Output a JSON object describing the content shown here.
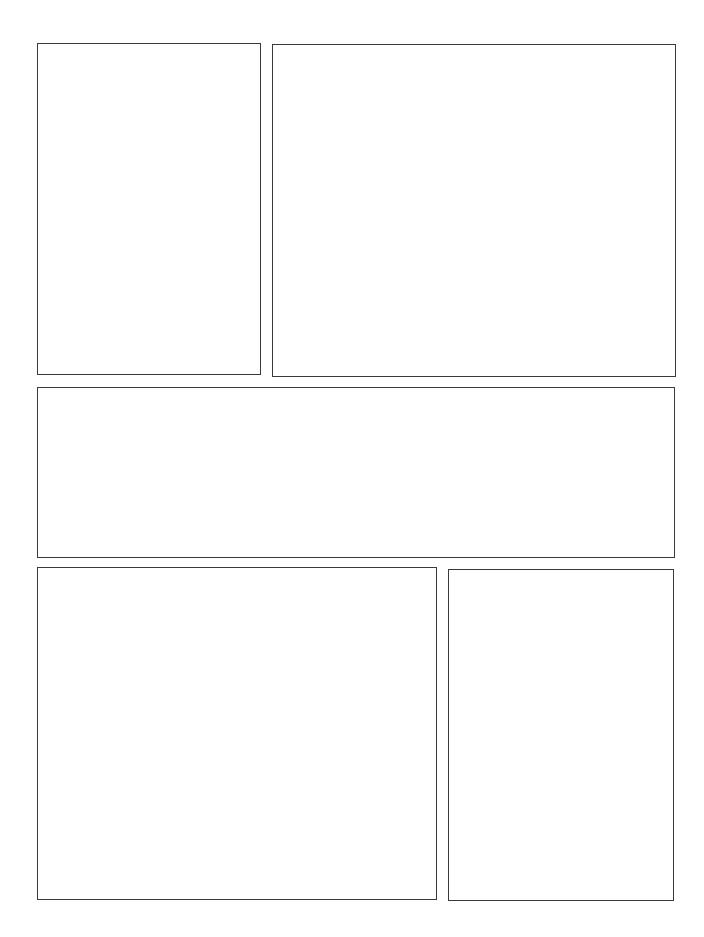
{
  "page": {
    "type": "comic-panel-template",
    "background": "#ffffff",
    "border_color": "#3a3a3a",
    "panels": [
      {
        "id": "panel-1",
        "x": 37,
        "y": 43,
        "w": 224,
        "h": 332
      },
      {
        "id": "panel-2",
        "x": 272,
        "y": 44,
        "w": 404,
        "h": 333
      },
      {
        "id": "panel-3",
        "x": 37,
        "y": 387,
        "w": 638,
        "h": 171
      },
      {
        "id": "panel-4",
        "x": 37,
        "y": 567,
        "w": 400,
        "h": 333
      },
      {
        "id": "panel-5",
        "x": 448,
        "y": 569,
        "w": 226,
        "h": 332
      }
    ]
  }
}
